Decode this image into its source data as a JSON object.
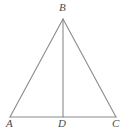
{
  "figure": {
    "background_color": "#ffffff",
    "stroke_color": "#8a8a8a",
    "label_color": "#4a4a4a",
    "stroke_width": 1.1,
    "width": 127,
    "height": 138,
    "vertices": [
      {
        "name": "A",
        "label": "A",
        "x": 10,
        "y": 117
      },
      {
        "name": "B",
        "label": "B",
        "x": 63,
        "y": 19
      },
      {
        "name": "C",
        "label": "C",
        "x": 116,
        "y": 117
      },
      {
        "name": "D",
        "label": "D",
        "x": 63,
        "y": 117
      }
    ],
    "segments": [
      {
        "name": "side-AB",
        "from": "A",
        "to": "B"
      },
      {
        "name": "side-BC",
        "from": "B",
        "to": "C"
      },
      {
        "name": "base-AC",
        "from": "A",
        "to": "C"
      },
      {
        "name": "median-BD",
        "from": "B",
        "to": "D"
      }
    ],
    "labels": {
      "A": "A",
      "B": "B",
      "C": "C",
      "D": "D"
    }
  }
}
